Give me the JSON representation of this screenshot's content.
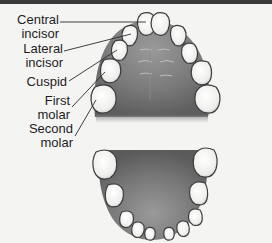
{
  "diagram": {
    "type": "dental-arch-anatomy",
    "labels": [
      {
        "line1": "Central",
        "line2": "incisor"
      },
      {
        "line1": "Lateral",
        "line2": "incisor"
      },
      {
        "line1": "Cuspid",
        "line2": ""
      },
      {
        "line1": "First",
        "line2": "molar"
      },
      {
        "line1": "Second",
        "line2": "molar"
      }
    ],
    "arches": [
      "upper",
      "lower"
    ],
    "colors": {
      "background": "#f4f4f3",
      "palate": "#7d7d7d",
      "tooth": "#f1f1f0",
      "tooth_outline": "#3c3c3c",
      "leader_line": "#2a2a2a",
      "top_rule": "#3a3a3a"
    }
  }
}
